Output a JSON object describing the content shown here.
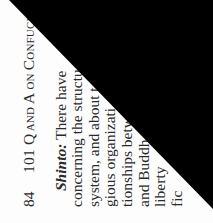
{
  "page": {
    "folio": "84",
    "running_head": {
      "number": "101",
      "q": "Q",
      "and": "AND",
      "a": "A",
      "on": "ON",
      "c": "C",
      "rest": "ONFUCI"
    },
    "paragraph": {
      "lead": "Shinto:",
      "lines": [
        " There have",
        "concerning the structu",
        "system, and about t",
        "gious organizati",
        "tionships betw",
        "and Buddh",
        "liberty",
        "fic"
      ]
    }
  },
  "overlay": {
    "color": "#000000",
    "shape": "triangle"
  }
}
